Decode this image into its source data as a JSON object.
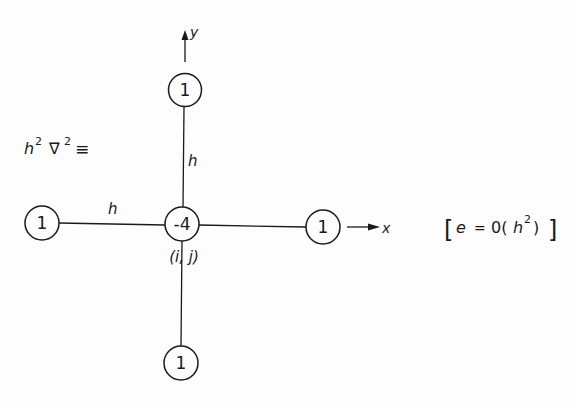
{
  "diagram": {
    "title_operator": {
      "base": "h",
      "sup1": "2",
      "nabla": "∇",
      "sup2": "2",
      "equiv": "≡"
    },
    "axes": {
      "x_label": "x",
      "y_label": "y"
    },
    "nodes": {
      "center": {
        "value": "-4",
        "index_label": "(i, j)"
      },
      "top": {
        "value": "1"
      },
      "bottom": {
        "value": "1"
      },
      "left": {
        "value": "1"
      },
      "right": {
        "value": "1"
      }
    },
    "spacing_labels": {
      "vertical": "h",
      "horizontal": "h"
    },
    "error_term": {
      "open": "[",
      "e": "e",
      "eq": "=",
      "order": "0(",
      "h": "h",
      "sup": "2",
      "close_paren": ")",
      "close": "]"
    },
    "colors": {
      "ink": "#1a1a1a",
      "background": "#fdfdfd"
    }
  }
}
